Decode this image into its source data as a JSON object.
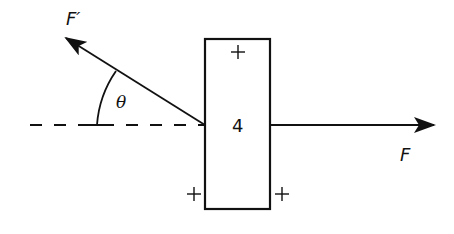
{
  "diagram": {
    "title": "",
    "colors": {
      "stroke": "#111111",
      "background": "#ffffff"
    },
    "block": {
      "label": "4",
      "x": 205,
      "y": 39,
      "width": 65,
      "height": 170
    },
    "plus_marks": [
      {
        "name": "top",
        "x": 238,
        "y": 52,
        "symbol": "+"
      },
      {
        "name": "bottom-left",
        "x": 194,
        "y": 194,
        "symbol": "+"
      },
      {
        "name": "bottom-right",
        "x": 282,
        "y": 194,
        "symbol": "+"
      }
    ],
    "forces": [
      {
        "name": "F",
        "label": "F",
        "from": [
          270,
          125
        ],
        "to": [
          434,
          125
        ],
        "direction": "right"
      },
      {
        "name": "F-prime",
        "label": "F′",
        "from": [
          205,
          125
        ],
        "to": [
          66,
          38
        ],
        "direction": "up-left"
      }
    ],
    "reference_line": {
      "style": "dashed",
      "from": [
        30,
        125
      ],
      "to": [
        205,
        125
      ]
    },
    "angle": {
      "label": "θ",
      "between": [
        "reference_line",
        "F-prime"
      ]
    }
  }
}
